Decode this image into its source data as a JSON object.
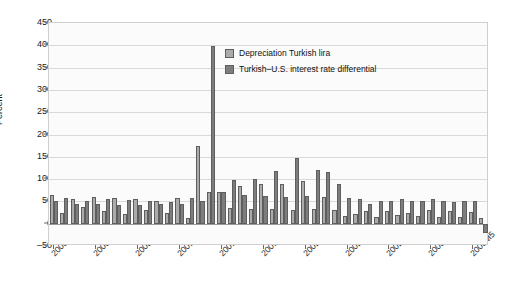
{
  "chart_data": {
    "type": "bar",
    "title": "",
    "xlabel": "",
    "ylabel": "Percent",
    "ylim": [
      -50,
      450
    ],
    "ytick_step": 50,
    "yticks": [
      "450",
      "400",
      "350",
      "300",
      "250",
      "200",
      "150",
      "100",
      "50",
      "0",
      "-50"
    ],
    "grid": true,
    "legend_position": "upper-center",
    "colors": {
      "depreciation": "#ababab",
      "differential": "#7d7d7d",
      "bar_border": "#5e5e5e",
      "gridline": "#d9d9d9",
      "plot_background": "#fbfbfb",
      "axis": "#6b6b6b"
    },
    "xtick_labels": [
      "2000M1",
      "2000M5",
      "2000M9",
      "2001M1",
      "2001M5",
      "2001M9",
      "2002M1",
      "2002M5",
      "2002M9",
      "2003M1",
      "2003M5"
    ],
    "xtick_indices": [
      0,
      4,
      8,
      12,
      16,
      20,
      24,
      28,
      32,
      36,
      40
    ],
    "categories": [
      "2000M1",
      "2000M2",
      "2000M3",
      "2000M4",
      "2000M5",
      "2000M6",
      "2000M7",
      "2000M8",
      "2000M9",
      "2000M10",
      "2000M11",
      "2000M12",
      "2001M1",
      "2001M2",
      "2001M3",
      "2001M4",
      "2001M5",
      "2001M6",
      "2001M7",
      "2001M8",
      "2001M9",
      "2001M10",
      "2001M11",
      "2001M12",
      "2002M1",
      "2002M2",
      "2002M3",
      "2002M4",
      "2002M5",
      "2002M6",
      "2002M7",
      "2002M8",
      "2002M9",
      "2002M10",
      "2002M11",
      "2002M12",
      "2003M1",
      "2003M2",
      "2003M3",
      "2003M4",
      "2003M5",
      "2003M6"
    ],
    "series": [
      {
        "name": "Depreciation Turkish lira",
        "key": "depreciation",
        "values": [
          65,
          23,
          55,
          38,
          60,
          28,
          57,
          22,
          55,
          30,
          52,
          23,
          58,
          12,
          175,
          70,
          72,
          36,
          85,
          32,
          88,
          32,
          90,
          30,
          96,
          32,
          60,
          30,
          18,
          22,
          28,
          14,
          28,
          20,
          24,
          18,
          30,
          16,
          28,
          14,
          26,
          12
        ]
      },
      {
        "name": "Turkish–U.S. interest rate differential",
        "key": "differential",
        "values": [
          52,
          58,
          45,
          52,
          44,
          56,
          42,
          54,
          43,
          50,
          44,
          48,
          45,
          58,
          52,
          398,
          72,
          98,
          65,
          100,
          62,
          118,
          60,
          148,
          62,
          120,
          115,
          88,
          58,
          55,
          45,
          50,
          52,
          55,
          50,
          52,
          55,
          50,
          48,
          52,
          50,
          -22
        ]
      }
    ]
  },
  "legend": {
    "items": [
      {
        "label": "Depreciation Turkish lira",
        "key": "depreciation"
      },
      {
        "label": "Turkish–U.S. interest rate differential",
        "key": "differential"
      }
    ]
  },
  "axes": {
    "y_title": "Percent"
  }
}
